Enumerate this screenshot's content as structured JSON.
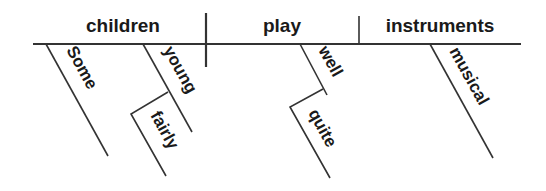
{
  "diagram": {
    "type": "sentence-diagram",
    "subject": "children",
    "verb": "play",
    "object": "instruments",
    "modifiers": [
      {
        "word": "Some",
        "modifies": "children"
      },
      {
        "word": "young",
        "modifies": "children"
      },
      {
        "word": "fairly",
        "modifies": "young"
      },
      {
        "word": "well",
        "modifies": "play"
      },
      {
        "word": "quite",
        "modifies": "well"
      },
      {
        "word": "musical",
        "modifies": "instruments"
      }
    ]
  },
  "colors": {
    "ink": "#1a1a1a",
    "line": "#333333",
    "background": "#ffffff"
  }
}
